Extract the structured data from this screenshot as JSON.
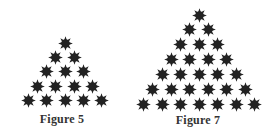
{
  "figures": [
    {
      "id": "figure-5",
      "caption": "Figure 5",
      "rows": 5,
      "total_stars": 15,
      "top": {
        "x": 65,
        "y": 43
      },
      "dx": 18.3,
      "dy": 14.4,
      "caption_pos": {
        "x": 62,
        "y": 112
      }
    },
    {
      "id": "figure-7",
      "caption": "Figure 7",
      "rows": 7,
      "total_stars": 28,
      "top": {
        "x": 199,
        "y": 15
      },
      "dx": 18.5,
      "dy": 14.9,
      "caption_pos": {
        "x": 198,
        "y": 113
      }
    }
  ],
  "style": {
    "star_color": "#222222",
    "star_core": "#2a2a2a",
    "caption_color": "#333333"
  },
  "pattern": "triangular arrangement of 8-pointed stars; figure n has rows of 1..n stars"
}
